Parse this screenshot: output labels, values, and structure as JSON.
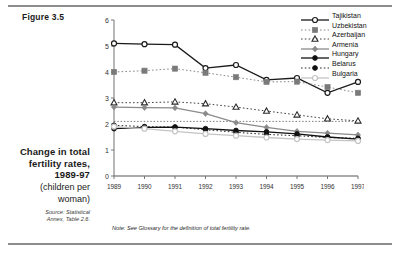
{
  "figure": {
    "label": "Figure 3.5"
  },
  "caption": {
    "title_line1": "Change in total",
    "title_line2": "fertility rates,",
    "title_line3": "1989-97",
    "sub_line1": "(children per",
    "sub_line2": "woman)",
    "source_line1": "Source: Statistical",
    "source_line2": "Annex, Table 2.6."
  },
  "note": "Note: See Glossary for the definition of total fertility rate.",
  "legend": {
    "position": "top-right",
    "entries": [
      {
        "label": "Tajikistan",
        "color": "#1a1a1a",
        "marker": "open-circle",
        "line": "solid"
      },
      {
        "label": "Uzbekistan",
        "color": "#7a7a7a",
        "marker": "filled-square",
        "line": "dotted"
      },
      {
        "label": "Azerbaijan",
        "color": "#2b2b2b",
        "marker": "open-triangle",
        "line": "dotted"
      },
      {
        "label": "Armenia",
        "color": "#8a8a8a",
        "marker": "filled-diamond",
        "line": "solid"
      },
      {
        "label": "Hungary",
        "color": "#111111",
        "marker": "filled-circle",
        "line": "solid"
      },
      {
        "label": "Belarus",
        "color": "#111111",
        "marker": "filled-circle",
        "line": "dotted"
      },
      {
        "label": "Bulgaria",
        "color": "#c4c4c4",
        "marker": "open-circle",
        "line": "solid"
      }
    ]
  },
  "chart_data": {
    "type": "line",
    "title": "Change in total fertility rates, 1989-97",
    "xlabel": "",
    "ylabel": "",
    "ylim": [
      0,
      6
    ],
    "yticks": [
      0,
      1,
      2,
      3,
      4,
      5,
      6
    ],
    "grid": false,
    "categories": [
      "1989",
      "1990",
      "1991",
      "1992",
      "1993",
      "1994",
      "1995",
      "1996",
      "1997"
    ],
    "reference_line": {
      "value": 2.1,
      "style": "dotted",
      "label": ""
    },
    "series": [
      {
        "name": "Tajikistan",
        "color": "#1a1a1a",
        "marker": "open-circle",
        "line": "solid",
        "values": [
          5.1,
          5.07,
          5.05,
          4.15,
          4.27,
          3.7,
          3.77,
          3.2,
          3.62
        ]
      },
      {
        "name": "Uzbekistan",
        "color": "#7a7a7a",
        "marker": "filled-square",
        "line": "dotted",
        "values": [
          4.0,
          4.05,
          4.13,
          3.97,
          3.8,
          3.62,
          3.63,
          3.42,
          3.2
        ]
      },
      {
        "name": "Azerbaijan",
        "color": "#2b2b2b",
        "marker": "open-triangle",
        "line": "dotted",
        "values": [
          2.82,
          2.82,
          2.85,
          2.78,
          2.65,
          2.5,
          2.35,
          2.2,
          2.12
        ]
      },
      {
        "name": "Armenia",
        "color": "#8a8a8a",
        "marker": "filled-diamond",
        "line": "solid",
        "values": [
          2.65,
          2.63,
          2.62,
          2.4,
          2.05,
          1.87,
          1.72,
          1.65,
          1.58
        ]
      },
      {
        "name": "Hungary",
        "color": "#111111",
        "marker": "filled-circle",
        "line": "solid",
        "values": [
          1.82,
          1.87,
          1.88,
          1.82,
          1.75,
          1.7,
          1.62,
          1.5,
          1.42
        ]
      },
      {
        "name": "Belarus",
        "color": "#111111",
        "marker": "filled-circle",
        "line": "dotted",
        "values": [
          1.95,
          1.9,
          1.88,
          1.78,
          1.68,
          1.6,
          1.55,
          1.48,
          1.45
        ]
      },
      {
        "name": "Bulgaria",
        "color": "#c4c4c4",
        "marker": "open-circle",
        "line": "solid",
        "values": [
          1.9,
          1.82,
          1.72,
          1.62,
          1.55,
          1.48,
          1.42,
          1.38,
          1.35
        ]
      }
    ]
  }
}
